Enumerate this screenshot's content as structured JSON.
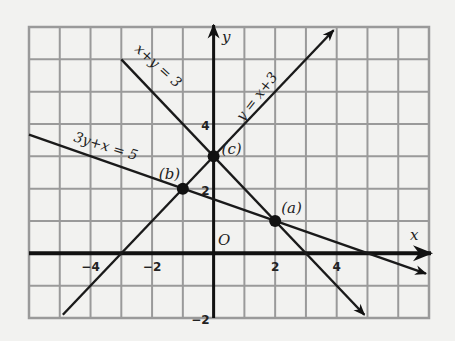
{
  "chart_data": {
    "type": "line",
    "title": "",
    "xlabel": "x",
    "ylabel": "y",
    "origin_label": "O",
    "xlim": [
      -6,
      7
    ],
    "ylim": [
      -2,
      7
    ],
    "grid": true,
    "x_ticks": [
      {
        "value": -4,
        "label": "−4"
      },
      {
        "value": -2,
        "label": "−2"
      },
      {
        "value": 2,
        "label": "2"
      },
      {
        "value": 4,
        "label": "4"
      }
    ],
    "y_ticks": [
      {
        "value": 4,
        "label": "4"
      },
      {
        "value": 2,
        "label": "2"
      },
      {
        "value": -2,
        "label": "−2"
      }
    ],
    "series": [
      {
        "name": "x+y = 3",
        "equation": "x+y=3",
        "x": [
          -3,
          4.9
        ],
        "y": [
          6,
          -1.9
        ],
        "arrow_end": true
      },
      {
        "name": "y = x+3",
        "equation": "y=x+3",
        "x": [
          -4.9,
          3.9
        ],
        "y": [
          -1.9,
          6.9
        ],
        "arrow_end": true
      },
      {
        "name": "3y+x = 5",
        "equation": "3y+x=5",
        "x": [
          -6,
          6.9
        ],
        "y": [
          3.67,
          -0.63
        ],
        "arrow_end": true
      }
    ],
    "points": [
      {
        "label": "(a)",
        "x": 2,
        "y": 1
      },
      {
        "label": "(b)",
        "x": -1,
        "y": 2
      },
      {
        "label": "(c)",
        "x": 0,
        "y": 3
      }
    ]
  }
}
